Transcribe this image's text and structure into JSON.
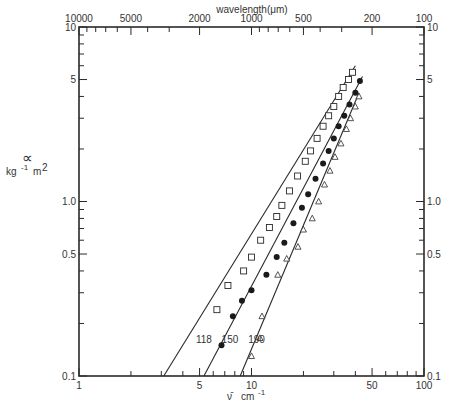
{
  "chart_data": {
    "type": "scatter",
    "title": "",
    "xlabel": "ν̄  cm⁻¹",
    "ylabel": "κ  kg⁻¹ m²",
    "x2label": "wavelength (μm)",
    "xscale": "log",
    "yscale": "log",
    "xlim": [
      1,
      100
    ],
    "ylim": [
      0.1,
      10
    ],
    "grid": false,
    "legend": "inline labels near lines",
    "x_ticks": [
      "1",
      "5",
      "10",
      "50",
      "100"
    ],
    "x2_ticks": [
      "10000",
      "5000",
      "2000",
      "1000",
      "500",
      "200",
      "100"
    ],
    "y_ticks_left": [
      "0.1",
      "0.5",
      "1.0",
      "5",
      "10"
    ],
    "y_ticks_right": [
      "0.1",
      "0.5",
      "1.0",
      "5",
      "10"
    ],
    "series": [
      {
        "name": "118",
        "marker": "open-square",
        "x": [
          6.3,
          7.3,
          9.0,
          10.0,
          11.3,
          12.7,
          14.0,
          15.0,
          16.6,
          18.5,
          20.5,
          22.0,
          24.0,
          26.0,
          28.0,
          30.0,
          32.0,
          34.0,
          36.5,
          38.5
        ],
        "y": [
          0.24,
          0.33,
          0.4,
          0.48,
          0.6,
          0.71,
          0.82,
          0.95,
          1.15,
          1.4,
          1.7,
          1.95,
          2.3,
          2.7,
          3.1,
          3.5,
          4.0,
          4.5,
          5.0,
          5.5
        ],
        "fit_line": {
          "x": [
            3.1,
            40.0
          ],
          "y": [
            0.1,
            6.0
          ]
        }
      },
      {
        "name": "150",
        "marker": "filled-circle",
        "x": [
          6.7,
          7.8,
          8.8,
          10.0,
          12.2,
          14.0,
          15.5,
          17.5,
          19.6,
          21.3,
          23.5,
          26.0,
          28.0,
          30.0,
          32.0,
          34.5,
          37.0,
          40.0,
          42.5
        ],
        "y": [
          0.15,
          0.22,
          0.27,
          0.31,
          0.38,
          0.48,
          0.58,
          0.75,
          0.92,
          1.1,
          1.35,
          1.65,
          1.95,
          2.3,
          2.7,
          3.1,
          3.6,
          4.2,
          4.9
        ],
        "fit_line": {
          "x": [
            5.3,
            44.0
          ],
          "y": [
            0.1,
            5.2
          ]
        }
      },
      {
        "name": "190",
        "marker": "open-triangle",
        "x": [
          10.0,
          11.2,
          11.5,
          14.2,
          16.0,
          18.6,
          20.0,
          22.5,
          24.5,
          26.5,
          28.5,
          30.5,
          33.0,
          35.5,
          37.5,
          40.0,
          42.0
        ],
        "y": [
          0.13,
          0.165,
          0.22,
          0.38,
          0.47,
          0.55,
          0.69,
          0.8,
          1.0,
          1.25,
          1.5,
          1.8,
          2.15,
          2.6,
          3.0,
          3.5,
          4.0
        ],
        "fit_line": {
          "x": [
            8.6,
            42.0
          ],
          "y": [
            0.1,
            4.2
          ]
        }
      }
    ],
    "annotations": [
      {
        "text": "118",
        "x": 5.3,
        "y": 0.155
      },
      {
        "text": "150",
        "x": 7.5,
        "y": 0.155
      },
      {
        "text": "190",
        "x": 10.7,
        "y": 0.155
      }
    ]
  },
  "labels": {
    "x_title_nu": "ν̄",
    "x_title_unit": "cm",
    "x_title_exp": "-1",
    "top_title": "wavelength(μm)",
    "y_title_kappa": "∝",
    "y_title_kg": "kg",
    "y_title_kg_exp": "-1",
    "y_title_m": "m",
    "y_title_m_exp": "2"
  }
}
